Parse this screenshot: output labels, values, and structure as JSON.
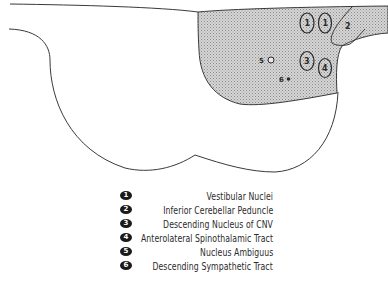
{
  "diagram": {
    "type": "brainstem-cross-section",
    "shaded_region_label": "lateral medulla (affected region)",
    "colors": {
      "outline": "#3a3a3a",
      "shading": "#c8c8c8",
      "badge": "#1a1a1a"
    },
    "markers": [
      {
        "id": "1",
        "label": "1",
        "shape": "ellipse"
      },
      {
        "id": "1b",
        "label": "1",
        "shape": "ellipse"
      },
      {
        "id": "2",
        "label": "2",
        "shape": "region"
      },
      {
        "id": "3",
        "label": "3",
        "shape": "ellipse"
      },
      {
        "id": "4",
        "label": "4",
        "shape": "ellipse"
      },
      {
        "id": "5",
        "label": "5",
        "shape": "open-circle"
      },
      {
        "id": "6",
        "label": "6",
        "shape": "dot"
      }
    ]
  },
  "legend": {
    "items": [
      {
        "number": "1",
        "label": "Vestibular Nuclei"
      },
      {
        "number": "2",
        "label": "Inferior Cerebellar Peduncle"
      },
      {
        "number": "3",
        "label": "Descending Nucleus of CNV"
      },
      {
        "number": "4",
        "label": "Anterolateral Spinothalamic Tract"
      },
      {
        "number": "5",
        "label": "Nucleus Ambiguus"
      },
      {
        "number": "6",
        "label": "Descending Sympathetic Tract"
      }
    ]
  }
}
